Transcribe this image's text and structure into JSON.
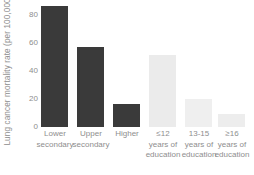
{
  "chart_data": {
    "type": "bar",
    "title": "",
    "xlabel": "",
    "ylabel": "Lung cancer mortality rate (per 100,000)",
    "ylim": [
      0,
      92
    ],
    "yticks": [
      0,
      20,
      40,
      60,
      80
    ],
    "ytick_labels": [
      "0",
      "20",
      "40",
      "60",
      "80"
    ],
    "grid": false,
    "legend": null,
    "categories": [
      "Lower secondary",
      "Upper secondary",
      "Higher",
      "≤12 years of education",
      "13-15 years of education",
      "≥16 years of education"
    ],
    "category_lines": [
      [
        "Lower",
        "secondary"
      ],
      [
        "Upper",
        "secondary"
      ],
      [
        "Higher"
      ],
      [
        "≤12",
        "years of",
        "education"
      ],
      [
        "13-15",
        "years of",
        "education"
      ],
      [
        "≥16",
        "years of",
        "education"
      ]
    ],
    "values": [
      88,
      58,
      16.5,
      52.5,
      20,
      9.5
    ],
    "bar_colors": [
      "#3a3a3a",
      "#3a3a3a",
      "#3a3a3a",
      "#ebebeb",
      "#efefef",
      "#ededed"
    ]
  },
  "axis": {
    "y_title": "Lung cancer mortality rate (per 100,000)",
    "tick_0": "0",
    "tick_20": "20",
    "tick_40": "40",
    "tick_60": "60",
    "tick_80": "80"
  },
  "labels": {
    "cat0_l0": "Lower",
    "cat0_l1": "secondary",
    "cat1_l0": "Upper",
    "cat1_l1": "secondary",
    "cat2_l0": "Higher",
    "cat3_l0": "≤12",
    "cat3_l1": "years of",
    "cat3_l2": "education",
    "cat4_l0": "13-15",
    "cat4_l1": "years of",
    "cat4_l2": "education",
    "cat5_l0": "≥16",
    "cat5_l1": "years of",
    "cat5_l2": "education"
  }
}
